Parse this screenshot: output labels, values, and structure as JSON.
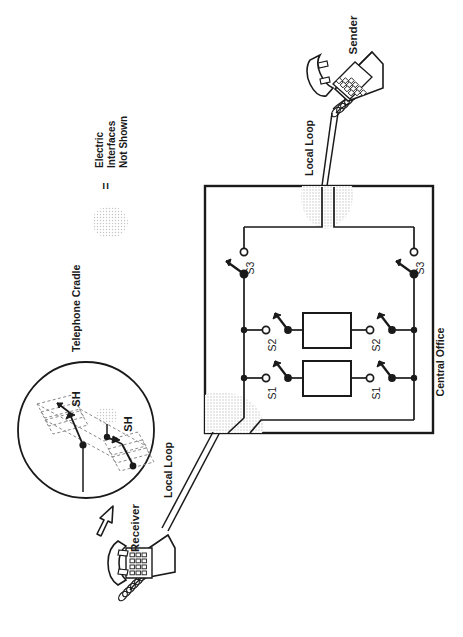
{
  "diagram": {
    "orientation": "rotated-90-ccw",
    "canvas": {
      "width": 463,
      "height": 637
    },
    "background_color": "#ffffff",
    "line_color": "#1a1a1a",
    "stipple_color": "#b9b9b9"
  },
  "labels": {
    "sender": "Sender",
    "receiver": "Receiver",
    "local_loop_top": "Local Loop",
    "local_loop_bottom": "Local Loop",
    "central_office": "Central Office",
    "telephone_cradle": "Telephone Cradle",
    "legend_equals": "=",
    "legend_text": "Electric\nInterfaces\nNot Shown",
    "legend_line1": "Electric",
    "legend_line2": "Interfaces",
    "legend_line3": "Not Shown"
  },
  "central_office": {
    "switch_labels": {
      "s1": "S1",
      "s2": "S2",
      "s3": "S3"
    },
    "left_rail_switches": [
      "S3",
      "S2",
      "S1"
    ],
    "right_rail_switches": [
      "S3",
      "S2",
      "S1"
    ],
    "relay_boxes": 2,
    "stipple_regions": 2
  },
  "magnifier": {
    "contact_label_1": "SH",
    "contact_label_2": "SH",
    "contact_count": 2,
    "description": "Telephone cradle switch hook contacts"
  },
  "telephones": [
    {
      "name": "sender-telephone",
      "keypad_rows": 4,
      "keypad_cols": 3
    },
    {
      "name": "receiver-telephone",
      "keypad_rows": 4,
      "keypad_cols": 3
    }
  ],
  "icons": {
    "magnifier": "magnifier-circle-icon",
    "callout_arrow": "block-arrow-icon",
    "stipple": "stipple-blob-icon",
    "telephone": "desk-telephone-icon",
    "switch": "spst-switch-icon"
  }
}
